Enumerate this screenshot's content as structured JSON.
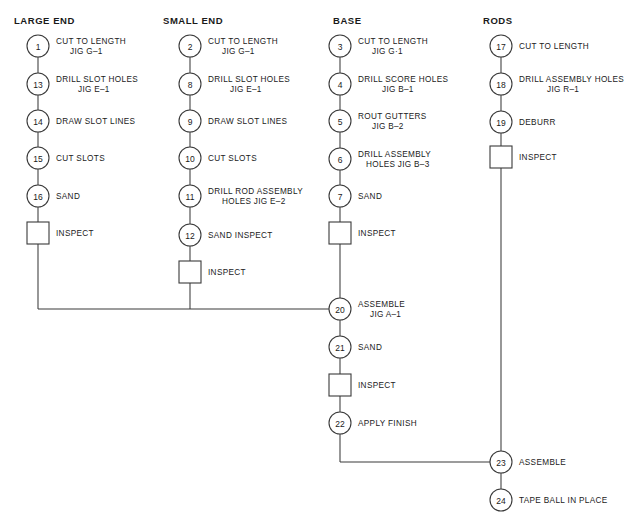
{
  "diagram": {
    "type": "process-flow",
    "geometry": {
      "width": 635,
      "height": 526,
      "circle_radius": 11,
      "square_size": 22,
      "merge_line_y": 309,
      "final_merge_line_y": 462
    },
    "style": {
      "line_color": "#3a3a3a",
      "text_color": "#1a1a1a",
      "background": "#ffffff"
    },
    "columns": [
      {
        "id": "large-end",
        "header": "LARGE END",
        "header_x": 14,
        "header_y": 24,
        "center_x": 38,
        "label_x": 56,
        "nodes": [
          {
            "shape": "circle",
            "num": "1",
            "y": 46,
            "label": "CUT TO LENGTH",
            "sub": "JIG G–1",
            "sub_indent": 14
          },
          {
            "shape": "circle",
            "num": "13",
            "y": 84,
            "label": "DRILL SLOT HOLES",
            "sub": "JIG E–1",
            "sub_indent": 22
          },
          {
            "shape": "circle",
            "num": "14",
            "y": 121,
            "label": "DRAW SLOT LINES",
            "sub": "",
            "sub_indent": 0
          },
          {
            "shape": "circle",
            "num": "15",
            "y": 158,
            "label": "CUT SLOTS",
            "sub": "",
            "sub_indent": 0
          },
          {
            "shape": "circle",
            "num": "16",
            "y": 196,
            "label": "SAND",
            "sub": "",
            "sub_indent": 0
          },
          {
            "shape": "square",
            "num": "",
            "y": 233,
            "label": "INSPECT",
            "sub": "",
            "sub_indent": 0
          }
        ],
        "tail_to_y": 309
      },
      {
        "id": "small-end",
        "header": "SMALL END",
        "header_x": 163,
        "header_y": 24,
        "center_x": 190,
        "label_x": 208,
        "nodes": [
          {
            "shape": "circle",
            "num": "2",
            "y": 46,
            "label": "CUT TO LENGTH",
            "sub": "JIG G–1",
            "sub_indent": 14
          },
          {
            "shape": "circle",
            "num": "8",
            "y": 84,
            "label": "DRILL SLOT HOLES",
            "sub": "JIG E–1",
            "sub_indent": 22
          },
          {
            "shape": "circle",
            "num": "9",
            "y": 121,
            "label": "DRAW SLOT LINES",
            "sub": "",
            "sub_indent": 0
          },
          {
            "shape": "circle",
            "num": "10",
            "y": 158,
            "label": "CUT SLOTS",
            "sub": "",
            "sub_indent": 0
          },
          {
            "shape": "circle",
            "num": "11",
            "y": 196,
            "label": "DRILL ROD ASSEMBLY",
            "sub": "HOLES JIG E–2",
            "sub_indent": 14
          },
          {
            "shape": "circle",
            "num": "12",
            "y": 235,
            "label": "SAND INSPECT",
            "sub": "",
            "sub_indent": 0
          },
          {
            "shape": "square",
            "num": "",
            "y": 272,
            "label": "INSPECT",
            "sub": "",
            "sub_indent": 0
          }
        ],
        "tail_to_y": 309
      },
      {
        "id": "base",
        "header": "BASE",
        "header_x": 333,
        "header_y": 24,
        "center_x": 340,
        "label_x": 358,
        "nodes": [
          {
            "shape": "circle",
            "num": "3",
            "y": 46,
            "label": "CUT TO LENGTH",
            "sub": "JIG G·1",
            "sub_indent": 14
          },
          {
            "shape": "circle",
            "num": "4",
            "y": 84,
            "label": "DRILL SCORE HOLES",
            "sub": "JIG B–1",
            "sub_indent": 24
          },
          {
            "shape": "circle",
            "num": "5",
            "y": 121,
            "label": "ROUT GUTTERS",
            "sub": "JIG B–2",
            "sub_indent": 14
          },
          {
            "shape": "circle",
            "num": "6",
            "y": 159,
            "label": "DRILL ASSEMBLY",
            "sub": "HOLES JIG B–3",
            "sub_indent": 8
          },
          {
            "shape": "circle",
            "num": "7",
            "y": 196,
            "label": "SAND",
            "sub": "",
            "sub_indent": 0
          },
          {
            "shape": "square",
            "num": "",
            "y": 233,
            "label": "INSPECT",
            "sub": "",
            "sub_indent": 0
          }
        ],
        "tail_to_y": 309
      },
      {
        "id": "rods",
        "header": "RODS",
        "header_x": 483,
        "header_y": 24,
        "center_x": 501,
        "label_x": 519,
        "nodes": [
          {
            "shape": "circle",
            "num": "17",
            "y": 46,
            "label": "CUT TO LENGTH",
            "sub": "",
            "sub_indent": 0
          },
          {
            "shape": "circle",
            "num": "18",
            "y": 84,
            "label": "DRILL ASSEMBLY HOLES",
            "sub": "JIG R–1",
            "sub_indent": 28
          },
          {
            "shape": "circle",
            "num": "19",
            "y": 122,
            "label": "DEBURR",
            "sub": "",
            "sub_indent": 0
          },
          {
            "shape": "square",
            "num": "",
            "y": 157,
            "label": "INSPECT",
            "sub": "",
            "sub_indent": 0
          }
        ],
        "tail_to_y": 462
      }
    ],
    "assembly_chain": {
      "center_x": 340,
      "label_x": 358,
      "nodes": [
        {
          "shape": "circle",
          "num": "20",
          "y": 309,
          "label": "ASSEMBLE",
          "sub": "JIG A–1",
          "sub_indent": 12
        },
        {
          "shape": "circle",
          "num": "21",
          "y": 347,
          "label": "SAND",
          "sub": "",
          "sub_indent": 0
        },
        {
          "shape": "square",
          "num": "",
          "y": 385,
          "label": "INSPECT",
          "sub": "",
          "sub_indent": 0
        },
        {
          "shape": "circle",
          "num": "22",
          "y": 423,
          "label": "APPLY FINISH",
          "sub": "",
          "sub_indent": 0
        }
      ]
    },
    "final_chain": {
      "center_x": 501,
      "label_x": 519,
      "nodes": [
        {
          "shape": "circle",
          "num": "23",
          "y": 462,
          "label": "ASSEMBLE",
          "sub": "",
          "sub_indent": 0
        },
        {
          "shape": "circle",
          "num": "24",
          "y": 500,
          "label": "TAPE BALL IN PLACE",
          "sub": "",
          "sub_indent": 0
        }
      ]
    },
    "connectors": [
      {
        "id": "merge-horizontal-to-20",
        "from_x": 38,
        "to_x": 329,
        "y": 309
      },
      {
        "id": "merge-horizontal-to-23",
        "from_x": 340,
        "to_x": 490,
        "y": 462
      },
      {
        "id": "base-22-down",
        "x": 340,
        "from_y": 434,
        "to_y": 462
      }
    ]
  }
}
